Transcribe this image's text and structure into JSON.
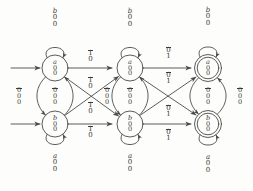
{
  "diagram": {
    "stroke_color": "#4a4a48",
    "text_color": "#3a3a38",
    "background": "#fdfdfb",
    "columns": 3,
    "states": [
      {
        "id": "q00",
        "col": 1,
        "row": "top",
        "accepting": false,
        "label": [
          "a",
          "0",
          "0"
        ]
      },
      {
        "id": "q01",
        "col": 1,
        "row": "bottom",
        "accepting": false,
        "label": [
          "b",
          "0",
          "0"
        ]
      },
      {
        "id": "q10",
        "col": 2,
        "row": "top",
        "accepting": false,
        "label": [
          "a",
          "0",
          "0"
        ]
      },
      {
        "id": "q11",
        "col": 2,
        "row": "bottom",
        "accepting": false,
        "label": [
          "b",
          "0",
          "0"
        ]
      },
      {
        "id": "q20",
        "col": 3,
        "row": "top",
        "accepting": true,
        "label": [
          "a",
          "0",
          "0"
        ]
      },
      {
        "id": "q21",
        "col": 3,
        "row": "bottom",
        "accepting": true,
        "label": [
          "b",
          "0",
          "0"
        ]
      }
    ],
    "vertical_arc_labels": [
      {
        "id": "v1",
        "col": 1,
        "label": [
          "0",
          "0",
          "0"
        ],
        "bar_index": 0
      },
      {
        "id": "v2",
        "col": 2,
        "label": [
          "0",
          "0",
          "0"
        ],
        "bar_index": 0
      },
      {
        "id": "v3",
        "col": 3,
        "label": [
          "0",
          "0",
          "0"
        ],
        "bar_index": 0
      }
    ],
    "side_labels": [
      {
        "id": "s1",
        "position": "left-of-col1",
        "label": [
          "0",
          "0",
          "0"
        ],
        "bar_index": 0
      },
      {
        "id": "s2",
        "position": "left-of-col2",
        "label": [
          "0",
          "0",
          "0"
        ],
        "bar_index": 0
      },
      {
        "id": "s3",
        "position": "right-of-col3",
        "label": [
          "0",
          "0",
          "0"
        ],
        "bar_index": 0
      }
    ],
    "self_loops": [
      {
        "id": "l1",
        "state": "q00",
        "side": "top",
        "label": [
          "b",
          "0",
          "0"
        ]
      },
      {
        "id": "l2",
        "state": "q01",
        "side": "bottom",
        "label": [
          "a",
          "0",
          "0"
        ]
      },
      {
        "id": "l3",
        "state": "q10",
        "side": "top",
        "label": [
          "b",
          "0",
          "0"
        ]
      },
      {
        "id": "l4",
        "state": "q11",
        "side": "bottom",
        "label": [
          "a",
          "0",
          "0"
        ]
      },
      {
        "id": "l5",
        "state": "q20",
        "side": "top",
        "label": [
          "b",
          "0",
          "0"
        ]
      },
      {
        "id": "l6",
        "state": "q21",
        "side": "bottom",
        "label": [
          "a",
          "0",
          "0"
        ]
      }
    ],
    "transitions": [
      {
        "id": "t1",
        "from": "q00",
        "to": "q10",
        "kind": "horizontal",
        "label": [
          "1",
          "0"
        ],
        "bar_index": 0
      },
      {
        "id": "t2",
        "from": "q01",
        "to": "q11",
        "kind": "horizontal",
        "label": [
          "1",
          "0"
        ],
        "bar_index": 0
      },
      {
        "id": "t3",
        "from": "q00",
        "to": "q11",
        "kind": "diagonal-down",
        "label": [
          "1",
          "0"
        ],
        "bar_index": 0
      },
      {
        "id": "t4",
        "from": "q01",
        "to": "q10",
        "kind": "diagonal-up",
        "label": [
          "1",
          "0"
        ],
        "bar_index": 0
      },
      {
        "id": "t5",
        "from": "q10",
        "to": "q20",
        "kind": "horizontal",
        "label": [
          "0",
          "1"
        ],
        "bar_index": 0
      },
      {
        "id": "t6",
        "from": "q11",
        "to": "q21",
        "kind": "horizontal",
        "label": [
          "0",
          "1"
        ],
        "bar_index": 0
      },
      {
        "id": "t7",
        "from": "q10",
        "to": "q21",
        "kind": "diagonal-down",
        "label": [
          "0",
          "1"
        ],
        "bar_index": 0
      },
      {
        "id": "t8",
        "from": "q11",
        "to": "q20",
        "kind": "diagonal-up",
        "label": [
          "0",
          "1"
        ],
        "bar_index": 0
      }
    ],
    "start_arrows": [
      {
        "id": "a1",
        "target": "q00"
      },
      {
        "id": "a2",
        "target": "q01"
      }
    ]
  }
}
